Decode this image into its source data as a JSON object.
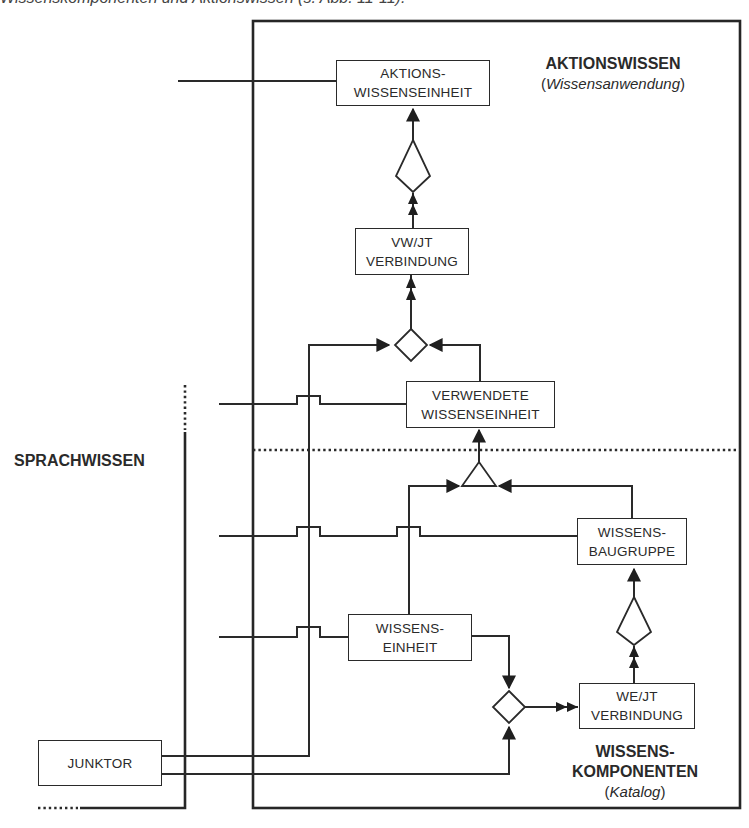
{
  "caption": "Wissenskomponenten und Aktionswissen (s. Abb. 11-11).",
  "regions": {
    "aktionswissen": {
      "title": "AKTIONSWISSEN",
      "subtitle_open": "(",
      "subtitle": "Wissensanwendung",
      "subtitle_close": ")"
    },
    "sprachwissen": {
      "title": "SPRACHWISSEN"
    },
    "wissenskomponenten": {
      "title_line1": "WISSENS-",
      "title_line2": "KOMPONENTEN",
      "subtitle_open": "(",
      "subtitle": "Katalog",
      "subtitle_close": ")"
    }
  },
  "boxes": {
    "aktions_wisseneinheit": {
      "line1": "AKTIONS-",
      "line2": "WISSENSEINHEIT"
    },
    "vw_jt_verbindung": {
      "line1": "VW/JT",
      "line2": "VERBINDUNG"
    },
    "verwendete_wisseneinheit": {
      "line1": "VERWENDETE",
      "line2": "WISSENSEINHEIT"
    },
    "wissensbaugruppe": {
      "line1": "WISSENS-",
      "line2": "BAUGRUPPE"
    },
    "wissenseinheit": {
      "line1": "WISSENS-",
      "line2": "EINHEIT"
    },
    "we_jt_verbindung": {
      "line1": "WE/JT",
      "line2": "VERBINDUNG"
    },
    "junktor": {
      "line1": "JUNKTOR"
    }
  },
  "symbols": {
    "kite": "inverted-pentagon-aggregation",
    "diamond": "diamond-junction",
    "triangle": "triangle-generalization",
    "single_arrow": "filled-arrowhead",
    "double_arrow": "double-filled-arrowhead"
  },
  "colors": {
    "line": "#2a2a2a",
    "background": "#ffffff"
  }
}
